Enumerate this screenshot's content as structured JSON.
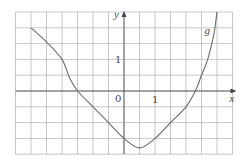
{
  "chart_data": {
    "type": "line",
    "title": "",
    "xlabel": "x",
    "ylabel": "y",
    "xlim": [
      -3.5,
      3.5
    ],
    "ylim": [
      -2,
      2.5
    ],
    "grid": true,
    "grid_step": 0.5,
    "tick_labels": {
      "origin": "0",
      "x": [
        "1"
      ],
      "y": [
        "1"
      ]
    },
    "legend": [],
    "annotations": [
      {
        "text": "g",
        "x": 2.6,
        "y": 1.8
      }
    ],
    "series": [
      {
        "name": "g",
        "x": [
          -3.0,
          -2.5,
          -2.0,
          -1.75,
          -1.5,
          -1.0,
          -0.5,
          0.0,
          0.5,
          1.0,
          1.5,
          2.0,
          2.3,
          2.5,
          2.7,
          2.9,
          3.0
        ],
        "y": [
          2.0,
          1.55,
          1.0,
          0.4,
          0.0,
          -0.5,
          -1.0,
          -1.5,
          -1.8,
          -1.5,
          -1.0,
          -0.5,
          0.0,
          0.5,
          1.0,
          1.8,
          2.5
        ]
      }
    ]
  }
}
